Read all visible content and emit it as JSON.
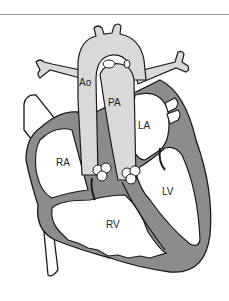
{
  "figure": {
    "type": "anatomical-diagram",
    "labels": {
      "aorta": "Ao",
      "pulmonary_artery": "PA",
      "left_atrium": "LA",
      "right_atrium": "RA",
      "left_ventricle": "LV",
      "right_ventricle": "RV"
    },
    "colors": {
      "myocardium": "#8c8c8c",
      "great_vessels": "#d9d9d9",
      "outline": "#1a1a1a",
      "chamber": "#ffffff",
      "rule": "#9a9a9a"
    }
  }
}
